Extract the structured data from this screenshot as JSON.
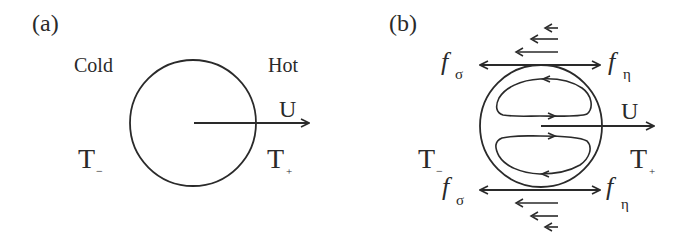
{
  "panel_a": {
    "label": "(a)",
    "cold": "Cold",
    "hot": "Hot",
    "velocity": "U",
    "t_minus": "T",
    "t_minus_sub": "−",
    "t_plus": "T",
    "t_plus_sub": "+"
  },
  "panel_b": {
    "label": "(b)",
    "velocity": "U",
    "t_minus": "T",
    "t_minus_sub": "−",
    "t_plus": "T",
    "t_plus_sub": "+",
    "f_sigma_top": "f",
    "f_sigma_top_sub": "σ",
    "f_eta_top": "f",
    "f_eta_top_sub": "η",
    "f_sigma_bottom": "f",
    "f_sigma_bottom_sub": "σ",
    "f_eta_bottom": "f",
    "f_eta_bottom_sub": "η"
  },
  "colors": {
    "stroke": "#2a2a2a",
    "background": "#ffffff"
  }
}
